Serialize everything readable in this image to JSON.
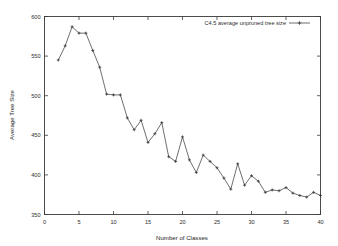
{
  "chart_data": {
    "type": "line",
    "title": "",
    "xlabel": "Number of Classes",
    "ylabel": "Average Tree Size",
    "xlim": [
      0,
      40
    ],
    "ylim": [
      350,
      600
    ],
    "xticks": [
      0,
      5,
      10,
      15,
      20,
      25,
      30,
      35,
      40
    ],
    "xtick_labels": [
      "0",
      "5",
      "10",
      "15",
      "20",
      "25",
      "30",
      "35",
      "40"
    ],
    "yticks": [
      350,
      400,
      450,
      500,
      550,
      600
    ],
    "ytick_labels": [
      "350",
      "400",
      "450",
      "500",
      "550",
      "600"
    ],
    "grid": false,
    "legend_position": "top-right",
    "marker": "plus",
    "line_color": "#4a4a4a",
    "series": [
      {
        "name": "C4.5 average unpruned tree size",
        "x": [
          2,
          3,
          4,
          5,
          6,
          7,
          8,
          9,
          10,
          11,
          12,
          13,
          14,
          15,
          16,
          17,
          18,
          19,
          20,
          21,
          22,
          23,
          24,
          25,
          26,
          27,
          28,
          29,
          30,
          31,
          32,
          33,
          34,
          35,
          36,
          37,
          38,
          39,
          40
        ],
        "values": [
          545,
          563,
          587,
          579,
          579,
          557,
          536,
          502,
          501,
          501,
          472,
          457,
          469,
          441,
          452,
          466,
          423,
          417,
          448,
          419,
          403,
          425,
          417,
          409,
          396,
          382,
          414,
          387,
          399,
          392,
          378,
          381,
          380,
          384,
          377,
          374,
          372,
          378,
          374
        ]
      }
    ]
  },
  "legend": {
    "entries": [
      {
        "label": "C4.5 average unpruned tree size"
      }
    ]
  }
}
